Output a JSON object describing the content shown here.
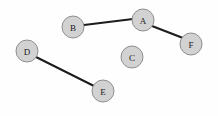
{
  "diagram": {
    "type": "node-link-graph",
    "width": 218,
    "height": 116,
    "background_color": "#fefefe",
    "node_fill_color": "#d2d2d2",
    "node_stroke_color": "#8f8f8f",
    "edge_color": "#1c1c1c",
    "node_radius": 11,
    "nodes": [
      {
        "id": "A",
        "label": "A",
        "cx": 143,
        "cy": 20
      },
      {
        "id": "B",
        "label": "B",
        "cx": 73,
        "cy": 27
      },
      {
        "id": "C",
        "label": "C",
        "cx": 132,
        "cy": 57
      },
      {
        "id": "D",
        "label": "D",
        "cx": 27,
        "cy": 51
      },
      {
        "id": "E",
        "label": "E",
        "cx": 103,
        "cy": 91
      },
      {
        "id": "F",
        "label": "F",
        "cx": 191,
        "cy": 44
      }
    ],
    "edges": [
      {
        "from": "B",
        "to": "A",
        "x1": 84,
        "y1": 25,
        "x2": 133,
        "y2": 19
      },
      {
        "from": "A",
        "to": "F",
        "x1": 152,
        "y1": 26,
        "x2": 183,
        "y2": 38
      },
      {
        "from": "D",
        "to": "E",
        "x1": 36,
        "y1": 57,
        "x2": 94,
        "y2": 86
      }
    ]
  }
}
